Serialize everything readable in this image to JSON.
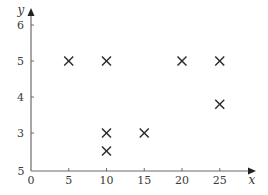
{
  "chart_data": {
    "type": "scatter",
    "title": "",
    "xlabel": "x",
    "ylabel": "y",
    "marker": "x",
    "grid": false,
    "legend": null,
    "x_ticks": [
      0,
      5,
      10,
      15,
      20,
      25
    ],
    "x_tick_labels": [
      "0",
      "5",
      "10",
      "15",
      "20",
      "25"
    ],
    "y_ticks": [
      3,
      4,
      5,
      6
    ],
    "y_tick_labels": [
      "3",
      "4",
      "5",
      "6"
    ],
    "y_origin_label": "5",
    "xlim": [
      0,
      27
    ],
    "ylim": [
      1.95,
      6.5
    ],
    "series": [
      {
        "name": "points",
        "points": [
          {
            "x": 5,
            "y": 5
          },
          {
            "x": 10,
            "y": 5
          },
          {
            "x": 20,
            "y": 5
          },
          {
            "x": 25,
            "y": 5
          },
          {
            "x": 25,
            "y": 3.8
          },
          {
            "x": 10,
            "y": 3
          },
          {
            "x": 15,
            "y": 3
          },
          {
            "x": 10,
            "y": 2.5
          }
        ]
      }
    ],
    "colors": {
      "axis": "#6b6b6b",
      "marker": "#2b2b2b",
      "text": "#3a3a3a"
    }
  }
}
